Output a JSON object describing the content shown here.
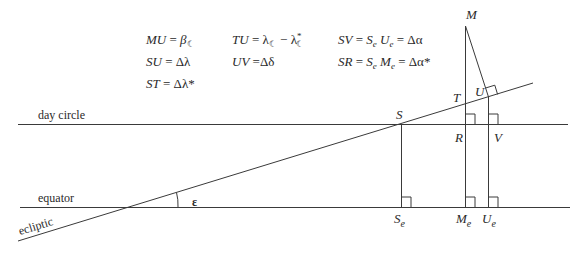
{
  "equations": {
    "col1": [
      "MU = β☾",
      "SU = Δλ",
      "ST = Δλ*"
    ],
    "col2": [
      "TU = λ☾ − λ*☾",
      "UV = Δδ"
    ],
    "col3": [
      "SV = Se Ue = Δα",
      "SR = Se Me = Δα*"
    ]
  },
  "eq": {
    "mu_lhs": "MU",
    "mu_rhs": "β",
    "su_lhs": "SU",
    "su_rhs": "Δλ",
    "st_lhs": "ST",
    "st_rhs": "Δλ*",
    "tu_lhs": "TU",
    "tu_rhs_a": "λ",
    "tu_rhs_b": "λ",
    "uv_lhs": "UV",
    "uv_rhs": "Δδ",
    "sv_lhs": "SV",
    "sv_rhs": "Δα",
    "sr_lhs": "SR",
    "sr_rhs": "Δα*",
    "equals": "=",
    "moon_sym": "☾",
    "star_sym": "*",
    "minus": "−",
    "S": "S",
    "U": "U",
    "M": "M",
    "e": "e"
  },
  "labels": {
    "day_circle": "day circle",
    "equator": "equator",
    "ecliptic": "ecliptic",
    "epsilon": "ε",
    "M": "M",
    "T": "T",
    "U": "U",
    "S": "S",
    "R": "R",
    "V": "V",
    "Se_main": "S",
    "Me_main": "M",
    "Ue_main": "U",
    "sub_e": "e"
  }
}
